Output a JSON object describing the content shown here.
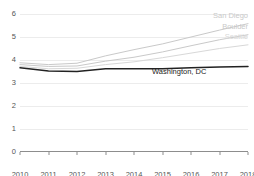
{
  "chart_title": "",
  "chart_data": {
    "type": "line",
    "title": "",
    "xlabel": "",
    "ylabel": "",
    "xlim": [
      2010,
      2018
    ],
    "ylim": [
      0,
      6
    ],
    "grid": true,
    "legend_position": "inline-right-end",
    "x": [
      2010,
      2011,
      2012,
      2013,
      2014,
      2015,
      2016,
      2017,
      2018
    ],
    "y_ticks": [
      "0",
      "1",
      "2",
      "3",
      "4",
      "5",
      "6"
    ],
    "x_ticks": [
      "2010",
      "2011",
      "2012",
      "2013",
      "2014",
      "2015",
      "2016",
      "2017",
      "2018"
    ],
    "series": [
      {
        "name": "San Diego",
        "color": "#c9c9c9",
        "values": [
          3.88,
          3.8,
          3.86,
          4.18,
          4.45,
          4.7,
          5.0,
          5.3,
          5.58
        ]
      },
      {
        "name": "Boulder",
        "color": "#c9c9c9",
        "values": [
          3.8,
          3.72,
          3.74,
          3.95,
          4.12,
          4.35,
          4.62,
          4.88,
          5.1
        ]
      },
      {
        "name": "Seattle",
        "color": "#d8d8d8",
        "values": [
          3.72,
          3.62,
          3.64,
          3.8,
          3.92,
          4.1,
          4.3,
          4.5,
          4.66
        ]
      },
      {
        "name": "Washington, DC",
        "color": "#222222",
        "values": [
          3.66,
          3.52,
          3.5,
          3.62,
          3.62,
          3.62,
          3.66,
          3.7,
          3.72
        ]
      }
    ]
  },
  "labels": {
    "san_diego": "San Diego",
    "boulder": "Boulder",
    "seattle": "Seattle",
    "washington_dc": "Washington, DC"
  }
}
